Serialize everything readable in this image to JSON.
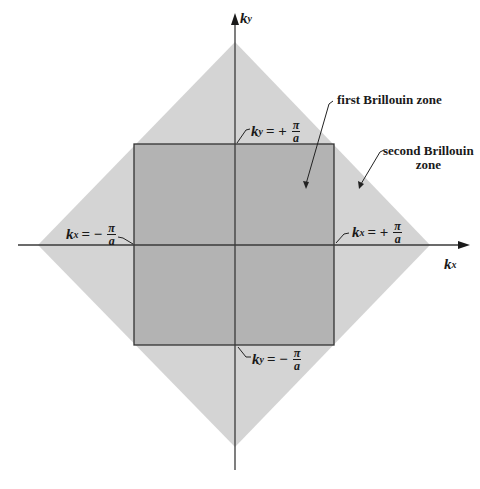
{
  "diagram": {
    "type": "brillouin-zone",
    "colors": {
      "second_zone": "#d4d4d4",
      "first_zone": "#b3b3b3",
      "axis": "#3a3a3a",
      "border": "#333333",
      "background": "#ffffff"
    },
    "axes": {
      "x_label": "k",
      "x_sub": "x",
      "y_label": "k",
      "y_sub": "y"
    },
    "zones": {
      "first": "first Brillouin zone",
      "second_line1": "second Brillouin",
      "second_line2": "zone"
    },
    "boundaries": {
      "top": {
        "k": "k",
        "sub": "y",
        "op": "= +",
        "num": "π",
        "den": "a"
      },
      "bottom": {
        "k": "k",
        "sub": "y",
        "op": "= −",
        "num": "π",
        "den": "a"
      },
      "left": {
        "k": "k",
        "sub": "x",
        "op": "= −",
        "num": "π",
        "den": "a"
      },
      "right": {
        "k": "k",
        "sub": "x",
        "op": "= +",
        "num": "π",
        "den": "a"
      }
    }
  }
}
